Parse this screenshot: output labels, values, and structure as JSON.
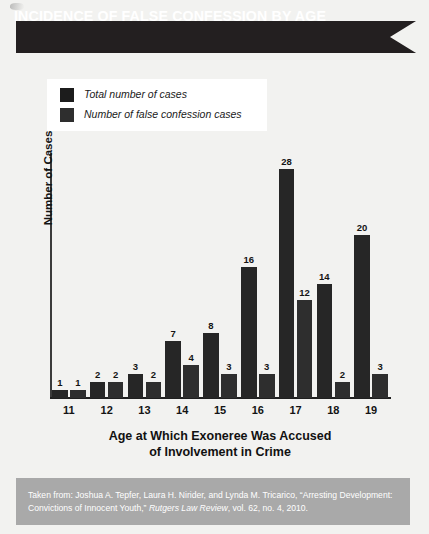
{
  "banner": {
    "title": "INCIDENCE OF FALSE CONFESSION BY AGE",
    "background_color": "#231f20",
    "text_color": "#ffffff"
  },
  "legend": {
    "position": "top-left",
    "items": [
      {
        "label": "Total number of cases",
        "color": "#1c1c1c"
      },
      {
        "label": "Number of false confession cases",
        "color": "#2e2e2e"
      }
    ]
  },
  "axes": {
    "y_title": "Number of Cases",
    "x_title_line1": "Age at Which Exoneree Was Accused",
    "x_title_line2": "of Involvement in Crime"
  },
  "footer": {
    "prefix": "Taken from: Joshua A. Tepfer, Laura H. Nirider, and Lynda M. Tricarico, “Arresting Development: Convictions of Innocent Youth,” ",
    "italic": "Rutgers Law Review",
    "suffix": ", vol. 62, no. 4, 2010.",
    "background_color": "#a9a9a9"
  },
  "chart_data": {
    "type": "bar",
    "title": "INCIDENCE OF FALSE CONFESSION BY AGE",
    "xlabel": "Age at Which Exoneree Was Accused of Involvement in Crime",
    "ylabel": "Number of Cases",
    "categories": [
      "11",
      "12",
      "13",
      "14",
      "15",
      "16",
      "17",
      "18",
      "19"
    ],
    "series": [
      {
        "name": "Total number of cases",
        "color": "#1c1c1c",
        "values": [
          1,
          2,
          3,
          7,
          8,
          16,
          28,
          14,
          20
        ]
      },
      {
        "name": "Number of false confession cases",
        "color": "#2e2e2e",
        "values": [
          1,
          2,
          2,
          4,
          3,
          3,
          12,
          2,
          3
        ]
      }
    ],
    "ylim": [
      0,
      30
    ],
    "grid": false,
    "legend_position": "top-left",
    "data_labels": true
  }
}
